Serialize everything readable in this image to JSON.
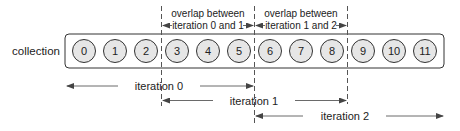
{
  "diagram": {
    "collection_label": "collection",
    "elements": [
      "0",
      "1",
      "2",
      "3",
      "4",
      "5",
      "6",
      "7",
      "8",
      "9",
      "10",
      "11"
    ],
    "overlaps": [
      {
        "line1": "overlap between",
        "line2": "iteration 0 and 1"
      },
      {
        "line1": "overlap between",
        "line2": "iteration 1 and 2"
      }
    ],
    "iterations": [
      {
        "label": "iteration 0"
      },
      {
        "label": "iteration 1"
      },
      {
        "label": "iteration 2"
      }
    ],
    "colors": {
      "circle_fill": "#e6e6e6",
      "stroke": "#333333",
      "text": "#222222",
      "arrow": "#444444"
    }
  }
}
